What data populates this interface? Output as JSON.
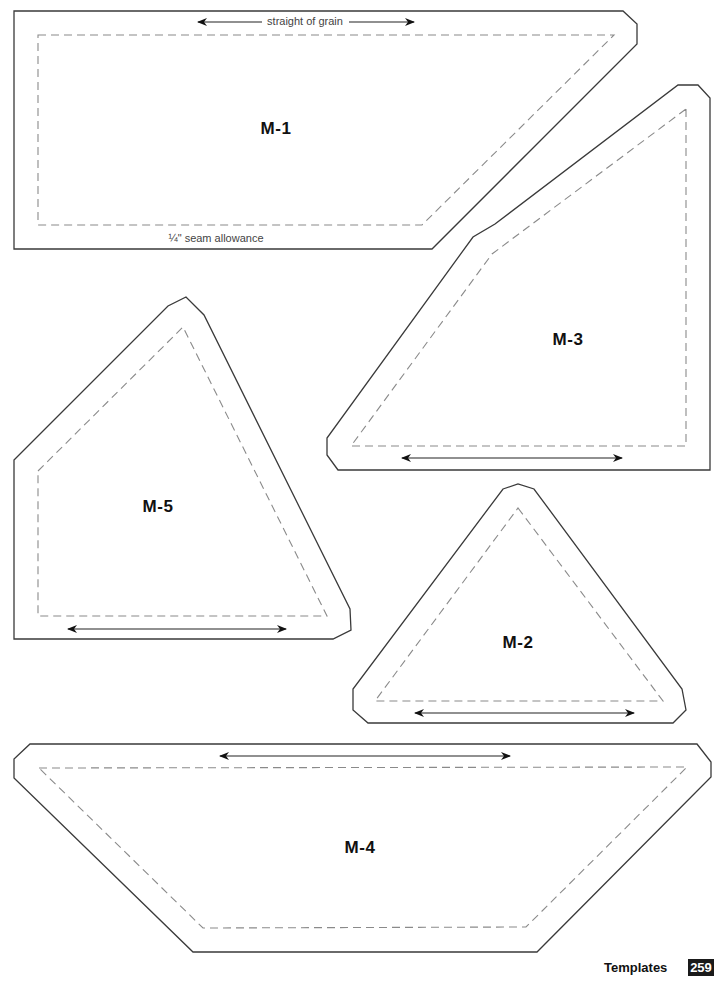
{
  "page": {
    "section_title": "Templates",
    "page_number": "259"
  },
  "templates": [
    {
      "id": "M-1",
      "label": "M-1",
      "label_pos": [
        276,
        129
      ],
      "grain_note": "straight of grain",
      "seam_note": "¼\" seam allowance",
      "cut_points": "14,11 623,11 637,24 637,44 432,249 14,249",
      "seam_points": "38,35 614,35 422,225 38,225",
      "grain_line": [
        198,
        22,
        414,
        22
      ]
    },
    {
      "id": "M-2",
      "label": "M-2",
      "label_pos": [
        518,
        643
      ],
      "cut_points": "503,489 518,484 534,489 682,689 686,710 673,723 368,723 353,710 353,689",
      "seam_points": "518,508 663,701 375,701",
      "grain_line": [
        415,
        713,
        634,
        713
      ]
    },
    {
      "id": "M-3",
      "label": "M-3",
      "label_pos": [
        568,
        340
      ],
      "cut_points": "678,85 698,85 710,98 710,470 338,470 327,455 327,438 473,237 495,224",
      "seam_points": "686,109 686,446 351,446 492,254",
      "grain_line": [
        402,
        458,
        622,
        458
      ]
    },
    {
      "id": "M-5",
      "label": "M-5",
      "label_pos": [
        158,
        507
      ],
      "cut_points": "14,460 168,306 186,297 204,315 350,609 351,630 333,639 14,639",
      "seam_points": "38,471 183,327 327,616 38,616",
      "grain_line": [
        68,
        629,
        286,
        629
      ]
    },
    {
      "id": "M-4",
      "label": "M-4",
      "label_pos": [
        360,
        848
      ],
      "cut_points": "30,744 697,744 711,762 711,777 537,952 193,952 14,778 14,759",
      "seam_points": "39,768 687,767 526,927 203,928",
      "grain_line": [
        220,
        756,
        510,
        756
      ]
    }
  ],
  "colors": {
    "cut_line": "#3a3a3a",
    "seam_line": "#8a8a8a",
    "text": "#111111",
    "page_badge_bg": "#1a1a1a"
  }
}
